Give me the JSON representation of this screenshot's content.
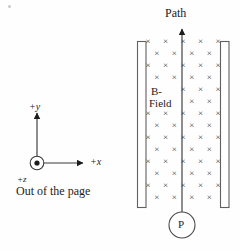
{
  "figure": {
    "width": 240,
    "height": 251,
    "background_color": "#fefefe",
    "ink_color": "#1c1c1c"
  },
  "labels": {
    "path": "Path",
    "b_field_line1": "B-",
    "b_field_line2": "Field",
    "particle": "P",
    "axis_y": "+y",
    "axis_x": "+x",
    "axis_z": "+z",
    "out_of_page": "Out of the page"
  },
  "axes": {
    "origin": {
      "x": 37,
      "y": 163
    },
    "y_arrow_tip": {
      "x": 37,
      "y": 111
    },
    "x_arrow_tip": {
      "x": 85,
      "y": 163
    },
    "origin_circle_radius": 7,
    "origin_dot_radius": 2.6,
    "note": "Dot-in-circle marks +z pointing out of the page"
  },
  "plates": [
    {
      "name": "left-plate",
      "x": 137,
      "y": 41,
      "width": 9,
      "height": 167
    },
    {
      "name": "right-plate",
      "x": 220,
      "y": 41,
      "width": 9,
      "height": 167
    }
  ],
  "path_line": {
    "x": 182,
    "y_start": 212,
    "y_end": 27,
    "direction": "upward",
    "arrow": true
  },
  "particle_circle": {
    "cx": 182,
    "cy": 225,
    "r": 13
  },
  "field_region": {
    "symbol": "×",
    "meaning": "magnetic field into the page",
    "x_min": 148,
    "x_max": 218,
    "y_min": 44,
    "y_max": 205,
    "row_spacing": 12,
    "col_spacing": 17.5,
    "stagger_offset": 8.75,
    "glyph_size": 9
  },
  "chart_data": {
    "type": "diagram",
    "elements": [
      {
        "name": "left-plate",
        "type": "rect",
        "x": 137,
        "y": 41,
        "w": 9,
        "h": 167
      },
      {
        "name": "right-plate",
        "type": "rect",
        "x": 220,
        "y": 41,
        "w": 9,
        "h": 167
      },
      {
        "name": "particle-path",
        "type": "arrow",
        "from": [
          182,
          212
        ],
        "to": [
          182,
          27
        ],
        "label": "Path"
      },
      {
        "name": "particle",
        "type": "circle",
        "center": [
          182,
          225
        ],
        "r": 13,
        "label": "P"
      },
      {
        "name": "field-crosses",
        "type": "grid",
        "symbol": "×",
        "label": "B-Field",
        "meaning": "into the page"
      },
      {
        "name": "axis-y",
        "type": "arrow",
        "from": [
          37,
          163
        ],
        "to": [
          37,
          111
        ],
        "label": "+y"
      },
      {
        "name": "axis-x",
        "type": "arrow",
        "from": [
          37,
          163
        ],
        "to": [
          85,
          163
        ],
        "label": "+x"
      },
      {
        "name": "axis-z",
        "type": "dot-in-circle",
        "center": [
          37,
          163
        ],
        "label": "+z",
        "note": "Out of the page"
      }
    ]
  }
}
